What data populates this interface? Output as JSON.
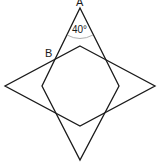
{
  "diagram": {
    "labels": {
      "A": "A",
      "B": "B",
      "angle": "40°"
    },
    "shapes": {
      "vertical_rhombus": {
        "top": [
          80,
          8
        ],
        "right": [
          119,
          86
        ],
        "bottom": [
          80,
          160
        ],
        "left": [
          42,
          86
        ]
      },
      "horizontal_rhombus": {
        "top": [
          80,
          46
        ],
        "right": [
          155,
          86
        ],
        "bottom": [
          80,
          126
        ],
        "left": [
          5,
          86
        ]
      }
    },
    "colors": {
      "stroke": "#1a1a1a",
      "arc": "#9a9a9a",
      "background": "#ffffff"
    }
  }
}
